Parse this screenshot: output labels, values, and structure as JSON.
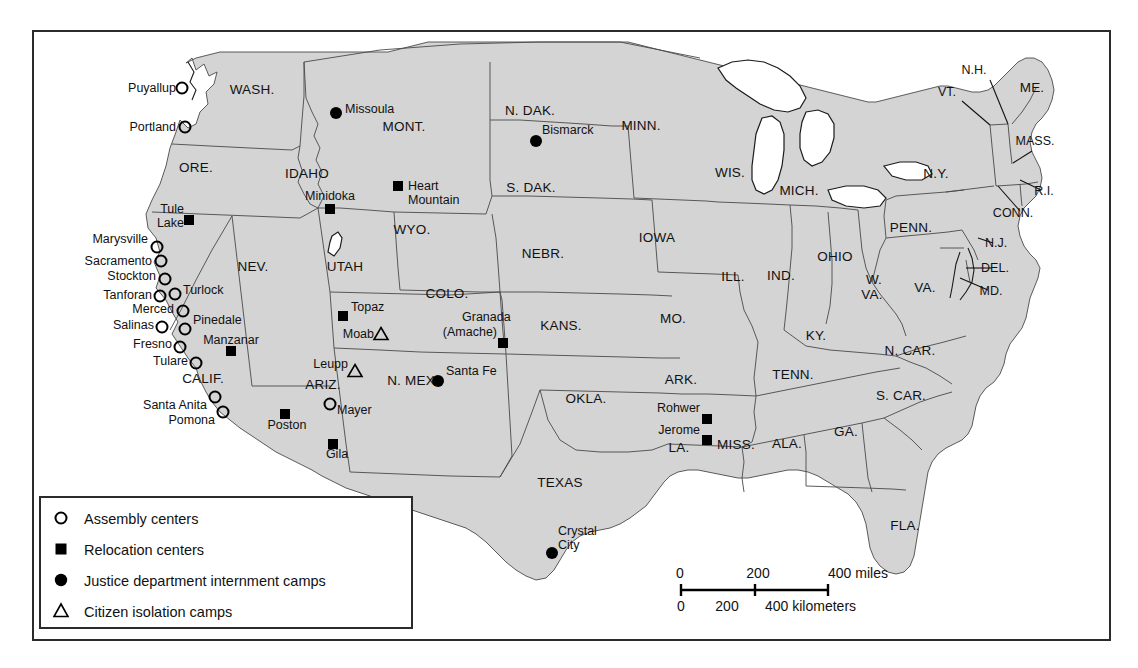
{
  "map": {
    "title": "Japanese American Internment Sites",
    "frame": {
      "x": 32,
      "y": 30,
      "width": 1078,
      "height": 610
    },
    "colors": {
      "land": "#d4d4d4",
      "water": "#ffffff",
      "state_border": "#4a4a4a",
      "coast": "#1a1a1a",
      "text": "#111111",
      "frame": "#2b2b2b"
    }
  },
  "legend": {
    "items": [
      {
        "symbol": "assembly",
        "label": "Assembly centers"
      },
      {
        "symbol": "relocation",
        "label": "Relocation centers"
      },
      {
        "symbol": "justice",
        "label": "Justice department internment camps"
      },
      {
        "symbol": "isolation",
        "label": "Citizen isolation camps"
      }
    ]
  },
  "scale": {
    "miles": {
      "ticks": [
        "0",
        "200",
        "400"
      ],
      "unit": "miles"
    },
    "kilometers": {
      "ticks": [
        "0",
        "200",
        "400"
      ],
      "unit": "kilometers"
    },
    "miles_label": "400 miles",
    "km_label": "400 kilometers"
  },
  "states": [
    {
      "abbr": "WASH.",
      "x": 252,
      "y": 94,
      "size": 15
    },
    {
      "abbr": "ORE.",
      "x": 196,
      "y": 172,
      "size": 15
    },
    {
      "abbr": "IDAHO",
      "x": 307,
      "y": 178,
      "size": 15
    },
    {
      "abbr": "MONT.",
      "x": 404,
      "y": 131,
      "size": 15
    },
    {
      "abbr": "WYO.",
      "x": 412,
      "y": 234,
      "size": 15
    },
    {
      "abbr": "NEV.",
      "x": 253,
      "y": 271,
      "size": 15
    },
    {
      "abbr": "UTAH",
      "x": 345,
      "y": 271,
      "size": 15
    },
    {
      "abbr": "COLO.",
      "x": 447,
      "y": 298,
      "size": 15
    },
    {
      "abbr": "N. DAK.",
      "x": 530,
      "y": 115,
      "size": 15
    },
    {
      "abbr": "S. DAK.",
      "x": 531,
      "y": 192,
      "size": 15
    },
    {
      "abbr": "NEBR.",
      "x": 543,
      "y": 258,
      "size": 15
    },
    {
      "abbr": "KANS.",
      "x": 561,
      "y": 330,
      "size": 15
    },
    {
      "abbr": "OKLA.",
      "x": 586,
      "y": 403,
      "size": 15
    },
    {
      "abbr": "TEXAS",
      "x": 560,
      "y": 487,
      "size": 15
    },
    {
      "abbr": "MINN.",
      "x": 641,
      "y": 130,
      "size": 15
    },
    {
      "abbr": "IOWA",
      "x": 657,
      "y": 242,
      "size": 15
    },
    {
      "abbr": "MO.",
      "x": 673,
      "y": 323,
      "size": 15
    },
    {
      "abbr": "ARK.",
      "x": 681,
      "y": 384,
      "size": 15
    },
    {
      "abbr": "LA.",
      "x": 679,
      "y": 452,
      "size": 15
    },
    {
      "abbr": "WIS.",
      "x": 730,
      "y": 177,
      "size": 15
    },
    {
      "abbr": "ILL.",
      "x": 733,
      "y": 281,
      "size": 15
    },
    {
      "abbr": "MISS.",
      "x": 736,
      "y": 449,
      "size": 15
    },
    {
      "abbr": "MICH.",
      "x": 799,
      "y": 195,
      "size": 15
    },
    {
      "abbr": "IND.",
      "x": 781,
      "y": 280,
      "size": 15
    },
    {
      "abbr": "KY.",
      "x": 816,
      "y": 340,
      "size": 15
    },
    {
      "abbr": "TENN.",
      "x": 793,
      "y": 379,
      "size": 15
    },
    {
      "abbr": "ALA.",
      "x": 787,
      "y": 448,
      "size": 15
    },
    {
      "abbr": "GA.",
      "x": 846,
      "y": 436,
      "size": 15
    },
    {
      "abbr": "OHIO",
      "x": 835,
      "y": 261,
      "size": 15
    },
    {
      "abbr": "W.",
      "x": 874,
      "y": 284,
      "size": 14
    },
    {
      "abbr": "VA.",
      "x": 872,
      "y": 299,
      "size": 14
    },
    {
      "abbr": "VA.",
      "x": 925,
      "y": 292,
      "size": 15
    },
    {
      "abbr": "N. CAR.",
      "x": 910,
      "y": 355,
      "size": 15
    },
    {
      "abbr": "S. CAR.",
      "x": 901,
      "y": 400,
      "size": 15
    },
    {
      "abbr": "FLA.",
      "x": 905,
      "y": 530,
      "size": 15
    },
    {
      "abbr": "PENN.",
      "x": 911,
      "y": 232,
      "size": 15
    },
    {
      "abbr": "N.Y.",
      "x": 936,
      "y": 178,
      "size": 15
    },
    {
      "abbr": "ME.",
      "x": 1032,
      "y": 92,
      "size": 15
    },
    {
      "abbr": "CALIF.",
      "x": 203,
      "y": 383,
      "size": 15
    },
    {
      "abbr": "ARIZ.",
      "x": 323,
      "y": 389,
      "size": 15
    },
    {
      "abbr": "N. MEX.",
      "x": 413,
      "y": 385,
      "size": 15
    }
  ],
  "small_states": [
    {
      "abbr": "N.H.",
      "x": 974,
      "y": 74,
      "lx1": 990,
      "ly1": 80,
      "lx2": 1008,
      "ly2": 124
    },
    {
      "abbr": "VT.",
      "x": 947,
      "y": 96,
      "lx1": 962,
      "ly1": 101,
      "lx2": 990,
      "ly2": 125
    },
    {
      "abbr": "MASS.",
      "x": 1035,
      "y": 145,
      "lx1": 1032,
      "ly1": 151,
      "lx2": 1013,
      "ly2": 163
    },
    {
      "abbr": "R.I.",
      "x": 1044,
      "y": 195,
      "lx1": 1041,
      "ly1": 190,
      "lx2": 1020,
      "ly2": 180
    },
    {
      "abbr": "CONN.",
      "x": 1013,
      "y": 217,
      "lx1": 1020,
      "ly1": 211,
      "lx2": 998,
      "ly2": 186
    },
    {
      "abbr": "N.J.",
      "x": 996,
      "y": 247,
      "lx1": 993,
      "ly1": 243,
      "lx2": 978,
      "ly2": 238
    },
    {
      "abbr": "DEL.",
      "x": 995,
      "y": 272,
      "lx1": 992,
      "ly1": 268,
      "lx2": 966,
      "ly2": 268
    },
    {
      "abbr": "MD.",
      "x": 991,
      "y": 295,
      "lx1": 988,
      "ly1": 290,
      "lx2": 960,
      "ly2": 278
    }
  ],
  "sites": [
    {
      "name": "Puyallup",
      "type": "assembly",
      "sx": 182,
      "sy": 88,
      "lx": 176,
      "ly": 92,
      "anchor": "end"
    },
    {
      "name": "Portland",
      "type": "assembly",
      "sx": 185,
      "sy": 127,
      "lx": 176,
      "ly": 131,
      "anchor": "end"
    },
    {
      "name": "Missoula",
      "type": "justice",
      "sx": 336,
      "sy": 113,
      "lx": 345,
      "ly": 113,
      "anchor": "start"
    },
    {
      "name": "Bismarck",
      "type": "justice",
      "sx": 536,
      "sy": 141,
      "lx": 542,
      "ly": 134,
      "anchor": "start"
    },
    {
      "name": "Minidoka",
      "type": "relocation",
      "sx": 330,
      "sy": 209,
      "lx": 330,
      "ly": 200,
      "anchor": "middle"
    },
    {
      "name": "Heart",
      "type": "relocation",
      "sx": 398,
      "sy": 186,
      "lx": 408,
      "ly": 190,
      "anchor": "start"
    },
    {
      "name": "Mountain",
      "type": "none",
      "sx": 0,
      "sy": 0,
      "lx": 408,
      "ly": 204,
      "anchor": "start"
    },
    {
      "name": "Tule",
      "type": "relocation",
      "sx": 189,
      "sy": 220,
      "lx": 184,
      "ly": 213,
      "anchor": "end"
    },
    {
      "name": "Lake",
      "type": "none",
      "sx": 0,
      "sy": 0,
      "lx": 184,
      "ly": 227,
      "anchor": "end"
    },
    {
      "name": "Marysville",
      "type": "assembly",
      "sx": 157,
      "sy": 247,
      "lx": 148,
      "ly": 243,
      "anchor": "end"
    },
    {
      "name": "Sacramento",
      "type": "assembly",
      "sx": 161,
      "sy": 261,
      "lx": 152,
      "ly": 265,
      "anchor": "end"
    },
    {
      "name": "Stockton",
      "type": "assembly",
      "sx": 165,
      "sy": 279,
      "lx": 156,
      "ly": 280,
      "anchor": "end"
    },
    {
      "name": "Tanforan",
      "type": "assembly",
      "sx": 160,
      "sy": 296,
      "lx": 152,
      "ly": 299,
      "anchor": "end"
    },
    {
      "name": "Turlock",
      "type": "assembly",
      "sx": 175,
      "sy": 294,
      "lx": 183,
      "ly": 294,
      "anchor": "start"
    },
    {
      "name": "Merced",
      "type": "assembly",
      "sx": 183,
      "sy": 311,
      "lx": 174,
      "ly": 313,
      "anchor": "end"
    },
    {
      "name": "Salinas",
      "type": "assembly",
      "sx": 162,
      "sy": 327,
      "lx": 154,
      "ly": 329,
      "anchor": "end"
    },
    {
      "name": "Pinedale",
      "type": "assembly",
      "sx": 185,
      "sy": 329,
      "lx": 193,
      "ly": 324,
      "anchor": "start"
    },
    {
      "name": "Fresno",
      "type": "assembly",
      "sx": 180,
      "sy": 347,
      "lx": 172,
      "ly": 348,
      "anchor": "end"
    },
    {
      "name": "Tulare",
      "type": "assembly",
      "sx": 196,
      "sy": 363,
      "lx": 188,
      "ly": 365,
      "anchor": "end"
    },
    {
      "name": "Santa Anita",
      "type": "assembly",
      "sx": 215,
      "sy": 397,
      "lx": 207,
      "ly": 409,
      "anchor": "end"
    },
    {
      "name": "Pomona",
      "type": "assembly",
      "sx": 223,
      "sy": 412,
      "lx": 215,
      "ly": 424,
      "anchor": "end"
    },
    {
      "name": "Manzanar",
      "type": "relocation",
      "sx": 231,
      "sy": 351,
      "lx": 231,
      "ly": 344,
      "anchor": "middle"
    },
    {
      "name": "Topaz",
      "type": "relocation",
      "sx": 343,
      "sy": 316,
      "lx": 351,
      "ly": 311,
      "anchor": "start"
    },
    {
      "name": "Moab",
      "type": "isolation",
      "sx": 381,
      "sy": 334,
      "lx": 374,
      "ly": 338,
      "anchor": "end"
    },
    {
      "name": "Leupp",
      "type": "isolation",
      "sx": 355,
      "sy": 371,
      "lx": 348,
      "ly": 368,
      "anchor": "end"
    },
    {
      "name": "Granada",
      "type": "none",
      "sx": 0,
      "sy": 0,
      "lx": 462,
      "ly": 321,
      "anchor": "start"
    },
    {
      "name": "(Amache)",
      "type": "relocation",
      "sx": 503,
      "sy": 343,
      "lx": 497,
      "ly": 336,
      "anchor": "end"
    },
    {
      "name": "Santa Fe",
      "type": "justice",
      "sx": 438,
      "sy": 381,
      "lx": 446,
      "ly": 375,
      "anchor": "start"
    },
    {
      "name": "Mayer",
      "type": "assembly",
      "sx": 330,
      "sy": 404,
      "lx": 337,
      "ly": 414,
      "anchor": "start"
    },
    {
      "name": "Poston",
      "type": "relocation",
      "sx": 285,
      "sy": 414,
      "lx": 287,
      "ly": 429,
      "anchor": "middle"
    },
    {
      "name": "Gila",
      "type": "relocation",
      "sx": 333,
      "sy": 444,
      "lx": 337,
      "ly": 458,
      "anchor": "middle"
    },
    {
      "name": "Rohwer",
      "type": "relocation",
      "sx": 707,
      "sy": 419,
      "lx": 700,
      "ly": 412,
      "anchor": "end"
    },
    {
      "name": "Jerome",
      "type": "relocation",
      "sx": 707,
      "sy": 440,
      "lx": 700,
      "ly": 434,
      "anchor": "end"
    },
    {
      "name": "Crystal",
      "type": "none",
      "sx": 0,
      "sy": 0,
      "lx": 558,
      "ly": 535,
      "anchor": "start"
    },
    {
      "name": "City",
      "type": "justice",
      "sx": 552,
      "sy": 553,
      "lx": 558,
      "ly": 549,
      "anchor": "start"
    }
  ]
}
